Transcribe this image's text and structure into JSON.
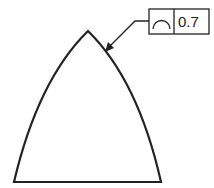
{
  "diagram": {
    "type": "gd-t-callout",
    "shape": "curved-triangle-profile",
    "feature_control_frame": {
      "symbol": "profile-of-a-line",
      "tolerance": "0.7"
    },
    "colors": {
      "stroke": "#222222",
      "background": "#ffffff"
    }
  }
}
